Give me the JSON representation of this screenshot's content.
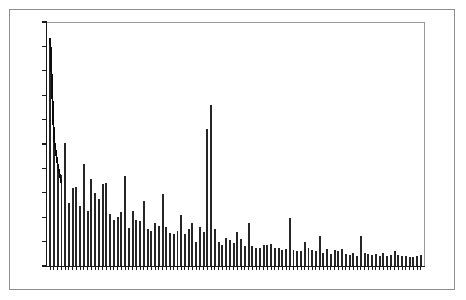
{
  "figure": {
    "kind": "scree-bar-chart",
    "background_color": "#ffffff",
    "page_border_color": "#8e8e8e",
    "plot_frame_color": "#9a9a9a",
    "axis_color": "#1a1a1a",
    "bar_color": "#262626",
    "line_color": "#0d0d0d"
  },
  "chart_data": {
    "type": "bar",
    "title": "",
    "subtitle": "",
    "xlabel": "",
    "ylabel": "",
    "grid": false,
    "legend": "none",
    "axis_tick_labels_visible": false,
    "x_tick_count": 100,
    "y_tick_count": 11,
    "ylim": [
      0,
      100
    ],
    "xlim": [
      0,
      101
    ],
    "categories": [
      "1",
      "2",
      "3",
      "4",
      "5",
      "6",
      "7",
      "8",
      "9",
      "10",
      "11",
      "12",
      "13",
      "14",
      "15",
      "16",
      "17",
      "18",
      "19",
      "20",
      "21",
      "22",
      "23",
      "24",
      "25",
      "26",
      "27",
      "28",
      "29",
      "30",
      "31",
      "32",
      "33",
      "34",
      "35",
      "36",
      "37",
      "38",
      "39",
      "40",
      "41",
      "42",
      "43",
      "44",
      "45",
      "46",
      "47",
      "48",
      "49",
      "50",
      "51",
      "52",
      "53",
      "54",
      "55",
      "56",
      "57",
      "58",
      "59",
      "60",
      "61",
      "62",
      "63",
      "64",
      "65",
      "66",
      "67",
      "68",
      "69",
      "70",
      "71",
      "72",
      "73",
      "74",
      "75",
      "76",
      "77",
      "78",
      "79",
      "80",
      "81",
      "82",
      "83",
      "84",
      "85",
      "86",
      "87",
      "88",
      "89",
      "90",
      "91",
      "92",
      "93",
      "94",
      "95",
      "96",
      "97",
      "98",
      "99",
      "100"
    ],
    "values": [
      93.0,
      52.0,
      41.0,
      37.5,
      50.5,
      26.0,
      32.0,
      32.5,
      24.5,
      42.0,
      22.5,
      35.5,
      30.0,
      27.5,
      33.5,
      34.0,
      21.5,
      19.0,
      20.0,
      22.0,
      37.0,
      15.5,
      22.5,
      19.0,
      18.5,
      26.5,
      15.0,
      14.5,
      17.5,
      16.5,
      29.5,
      16.0,
      13.5,
      13.0,
      14.5,
      21.0,
      13.0,
      15.0,
      17.5,
      10.0,
      16.0,
      14.0,
      56.0,
      66.0,
      15.0,
      10.0,
      8.5,
      11.5,
      10.5,
      9.5,
      14.0,
      11.0,
      8.0,
      17.5,
      8.0,
      7.5,
      7.5,
      8.5,
      8.5,
      9.0,
      7.5,
      7.5,
      6.5,
      7.0,
      19.5,
      6.5,
      6.0,
      6.0,
      10.0,
      7.5,
      6.5,
      6.0,
      12.5,
      5.5,
      7.0,
      5.0,
      6.5,
      6.0,
      7.0,
      5.0,
      4.5,
      5.5,
      4.0,
      12.5,
      5.5,
      5.0,
      4.5,
      5.0,
      4.0,
      5.5,
      4.0,
      4.5,
      6.0,
      4.5,
      4.0,
      4.0,
      3.5,
      3.5,
      4.0,
      4.5
    ],
    "overlay_line": {
      "name": "trend-line",
      "x": [
        1,
        2,
        3,
        4
      ],
      "y": [
        93.0,
        52.0,
        41.5,
        34.0
      ]
    }
  }
}
